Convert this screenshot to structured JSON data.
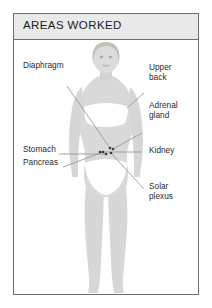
{
  "card": {
    "header": {
      "title": "AREAS WORKED"
    }
  },
  "figure": {
    "name": "female-body-front-view",
    "skin_color": "#d9d9d9",
    "underwear_color": "#ffffff",
    "hair_color": "#c8c4bc",
    "leader_color": "#9a9a9a",
    "marker_color": "#3a3a3a"
  },
  "callouts": {
    "left": [
      {
        "id": "diaphragm",
        "label": "Diaphragm"
      },
      {
        "id": "stomach",
        "label": "Stomach"
      },
      {
        "id": "pancreas",
        "label": "Pancreas"
      }
    ],
    "right": [
      {
        "id": "upper-back",
        "label": "Upper\nback"
      },
      {
        "id": "adrenal-gland",
        "label": "Adrenal\ngland"
      },
      {
        "id": "kidney",
        "label": "Kidney"
      },
      {
        "id": "solar-plexus",
        "label": "Solar\nplexus"
      }
    ]
  }
}
